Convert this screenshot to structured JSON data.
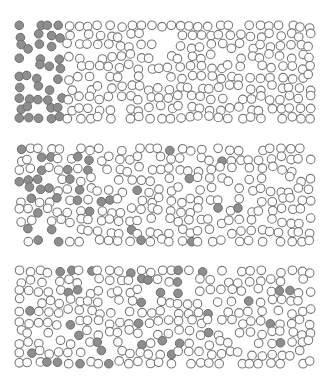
{
  "diagram": {
    "type": "particle-diffusion",
    "panels": [
      {
        "id": "initial",
        "top": 20,
        "height": 104,
        "rows": 10,
        "cols": 30,
        "mode": "left-block",
        "filled_cols": 4.5,
        "seed": 11
      },
      {
        "id": "partial-mix",
        "top": 143,
        "height": 104,
        "rows": 10,
        "cols": 30,
        "mode": "gradient",
        "seed": 29
      },
      {
        "id": "fully-mixed",
        "top": 265,
        "height": 104,
        "rows": 10,
        "cols": 30,
        "mode": "uniform",
        "seed": 47
      }
    ],
    "particle": {
      "radius": 4.3,
      "filled_color": "#8e8e8e",
      "open_color": "#ffffff",
      "stroke_color": "#7a7a7a"
    },
    "filled_count_per_panel": 36
  }
}
